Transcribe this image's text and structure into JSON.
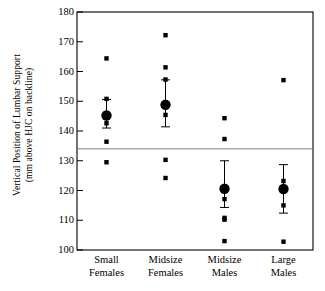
{
  "chart_data": {
    "type": "scatter",
    "title": "",
    "xlabel": "",
    "ylabel": "Vertical Position of Lumbar Support (mm above HJC on backline)",
    "ylabel_line1": "Vertical Position of Lumbar Support",
    "ylabel_line2": "(mm above HJC on backline)",
    "categories": [
      "Small Females",
      "Midsize Females",
      "Midsize Males",
      "Large Males"
    ],
    "category_lines": [
      [
        "Small",
        "Females"
      ],
      [
        "Midsize",
        "Females"
      ],
      [
        "Midsize",
        "Males"
      ],
      [
        "Large",
        "Males"
      ]
    ],
    "ylim": [
      100,
      180
    ],
    "yticks": [
      100,
      110,
      120,
      130,
      140,
      150,
      160,
      170,
      180
    ],
    "ytick_labels": [
      "100",
      "110",
      "120",
      "130",
      "140",
      "150",
      "160",
      "170",
      "180"
    ],
    "grid": false,
    "legend": "none",
    "reference_line": {
      "value": 134,
      "orientation": "horizontal",
      "color": "#808080"
    },
    "series": [
      {
        "name": "Small Females",
        "mean": 145.2,
        "error_low": 141.0,
        "error_high": 150.6,
        "points": [
          164.4,
          150.8,
          142.6,
          136.4,
          129.5
        ]
      },
      {
        "name": "Midsize Females",
        "mean": 148.8,
        "error_low": 141.4,
        "error_high": 157.2,
        "points": [
          172.2,
          161.4,
          157.3,
          145.4,
          130.3,
          124.2
        ]
      },
      {
        "name": "Midsize Males",
        "mean": 120.6,
        "error_low": 114.3,
        "error_high": 130.0,
        "points": [
          144.3,
          137.3,
          117.1,
          110.8,
          110.2,
          103.0
        ]
      },
      {
        "name": "Large Males",
        "mean": 120.5,
        "error_low": 112.4,
        "error_high": 128.7,
        "points": [
          157.1,
          123.2,
          115.0,
          102.8
        ]
      }
    ],
    "marker_mean": "filled-circle",
    "marker_point": "small-filled-square",
    "series_color": "#000000",
    "axis_color": "#000000",
    "background": "#ffffff"
  }
}
